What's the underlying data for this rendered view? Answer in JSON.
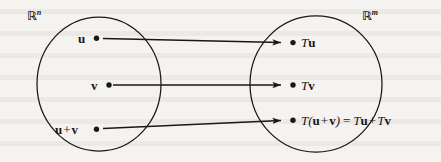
{
  "figure": {
    "domain_set": {
      "symbol": "R",
      "superscript": "n",
      "label_full": "ℝⁿ"
    },
    "codomain_set": {
      "symbol": "R",
      "superscript": "m",
      "label_full": "ℝᵐ"
    },
    "domain_points": [
      {
        "name": "u",
        "label": "u"
      },
      {
        "name": "v",
        "label": "v"
      },
      {
        "name": "u-plus-v",
        "label_left": "u",
        "operator": "+",
        "label_right": "v"
      }
    ],
    "codomain_points": [
      {
        "name": "Tu",
        "T": "T",
        "arg": "u"
      },
      {
        "name": "Tv",
        "T": "T",
        "arg": "v"
      },
      {
        "name": "T-of-u-plus-v",
        "T": "T",
        "open_paren": "(",
        "arg_left": "u",
        "operator": "+",
        "arg_right": "v",
        "close_paren": ")",
        "equals": "=",
        "rhs_T1": "T",
        "rhs_arg1": "u",
        "rhs_operator": "+",
        "rhs_T2": "T",
        "rhs_arg2": "v"
      }
    ],
    "arrows": [
      {
        "name": "arrow-u-to-Tu"
      },
      {
        "name": "arrow-v-to-Tv"
      },
      {
        "name": "arrow-uv-to-Tuv"
      }
    ],
    "colors": {
      "ink": "#1a1715",
      "paper": "#f4f3f0"
    }
  }
}
